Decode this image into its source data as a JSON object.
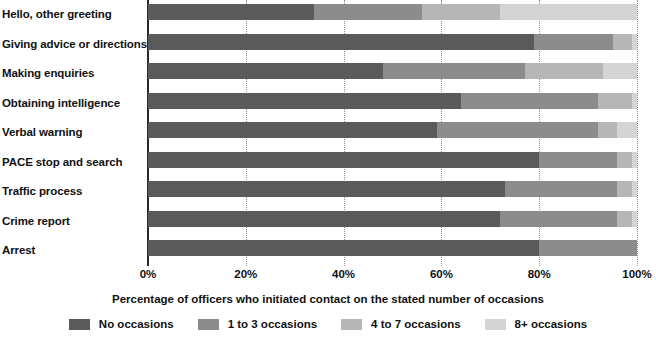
{
  "chart_data": {
    "type": "bar",
    "orientation": "horizontal",
    "stacked": true,
    "stack_mode": "percent",
    "title": "",
    "xlabel": "Percentage of officers who initiated contact on the stated number of occasions",
    "ylabel": "",
    "xlim": [
      0,
      100
    ],
    "xticks": [
      0,
      20,
      40,
      60,
      80,
      100
    ],
    "xtick_labels": [
      "0%",
      "20%",
      "40%",
      "60%",
      "80%",
      "100%"
    ],
    "grid": "vertical-dotted",
    "legend_position": "bottom-center",
    "categories": [
      "Hello, other greeting",
      "Giving advice or directions",
      "Making enquiries",
      "Obtaining intelligence",
      "Verbal warning",
      "PACE stop and search",
      "Traffic process",
      "Crime report",
      "Arrest"
    ],
    "series": [
      {
        "name": "No occasions",
        "color": "#5a5a5a",
        "values": [
          34,
          79,
          48,
          64,
          59,
          80,
          73,
          72,
          80
        ]
      },
      {
        "name": "1 to 3 occasions",
        "color": "#8c8c8c",
        "values": [
          22,
          16,
          29,
          28,
          33,
          16,
          23,
          24,
          20
        ]
      },
      {
        "name": "4 to 7 occasions",
        "color": "#b6b6b6",
        "values": [
          16,
          4,
          16,
          7,
          4,
          3,
          3,
          3,
          0
        ]
      },
      {
        "name": "8+ occasions",
        "color": "#d4d4d4",
        "values": [
          28,
          1,
          7,
          1,
          4,
          1,
          1,
          1,
          0
        ]
      }
    ]
  }
}
